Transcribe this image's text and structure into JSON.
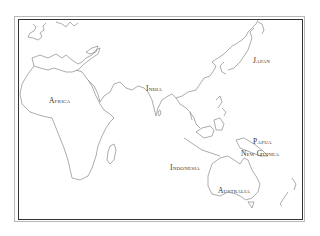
{
  "map": {
    "type": "outline-map",
    "region": "Africa, Asia, Oceania",
    "labels": [
      {
        "id": "africa",
        "text": "Africa"
      },
      {
        "id": "india",
        "text": "India"
      },
      {
        "id": "japan",
        "text": "Japan"
      },
      {
        "id": "papua",
        "text": "Papua"
      },
      {
        "id": "new-guinea",
        "text": "New Guinea"
      },
      {
        "id": "indonesia",
        "text": "Indonesia"
      },
      {
        "id": "australia",
        "text": "Australia"
      }
    ],
    "colors": {
      "coastline": "#8a8a8a",
      "frame": "#333333",
      "background": "#ffffff"
    }
  }
}
